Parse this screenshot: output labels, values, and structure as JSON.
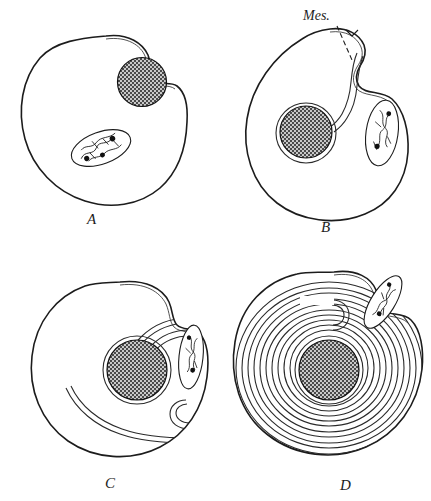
{
  "figure": {
    "background_color": "#ffffff",
    "ink_color": "#1c1c1c",
    "width": 431,
    "height": 501,
    "panel_count": 4,
    "layout": "2x2 grid"
  },
  "annotations": {
    "mesosome_label": "Mes.",
    "leader_line_style": "dashed"
  },
  "panels": [
    {
      "letter": "A",
      "label": "A",
      "stage": 1,
      "description": "Cell with surface notch containing a dark mesosome body; nucleoid lies lower left of centre",
      "cell_shape": "round with deep notch at upper right",
      "mesosome_turns": 0,
      "dark_body": {
        "present": true,
        "position": "in surface notch, upper right",
        "fill": "cross-hatch dark"
      },
      "nucleoid": {
        "present": true,
        "orientation": "tilted ellipse",
        "granules": 3,
        "position": "lower centre"
      },
      "cytoplasm_stipple": true
    },
    {
      "letter": "B",
      "label": "B",
      "stage": 2,
      "description": "Mesosome has invaginated; a narrow channel runs from the cell surface to the central dark body, and the nucleoid sits in a separate lobe at the right",
      "cell_shape": "round with invagination channel at upper right",
      "mesosome_turns": 0,
      "dark_body": {
        "present": true,
        "position": "centre",
        "fill": "cross-hatch dark"
      },
      "nucleoid": {
        "present": true,
        "orientation": "upright ellipse",
        "granules": 2,
        "position": "right lobe"
      },
      "cytoplasm_stipple": true,
      "callout": "Mes."
    },
    {
      "letter": "C",
      "label": "C",
      "stage": 3,
      "description": "Membrane has formed one and a half concentric turns around the central dark body",
      "cell_shape": "round with shallow shoulder at right",
      "mesosome_turns": 2,
      "dark_body": {
        "present": true,
        "position": "centre",
        "fill": "cross-hatch dark"
      },
      "nucleoid": {
        "present": true,
        "orientation": "upright ellipse",
        "granules": 2,
        "position": "right margin"
      },
      "cytoplasm_stipple": true
    },
    {
      "letter": "D",
      "label": "D",
      "stage": 4,
      "description": "Membrane elaborated into many tightly packed concentric lamellae filling most of the cell",
      "cell_shape": "round with shoulder at upper right",
      "mesosome_turns": 10,
      "dark_body": {
        "present": true,
        "position": "centre",
        "fill": "cross-hatch dark"
      },
      "nucleoid": {
        "present": true,
        "orientation": "tilted ellipse",
        "granules": 2,
        "position": "upper right lobe"
      },
      "cytoplasm_stipple": true
    }
  ]
}
